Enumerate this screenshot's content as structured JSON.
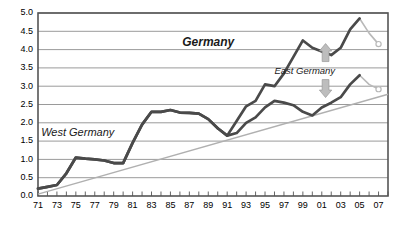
{
  "chart_data": {
    "type": "line",
    "title": "",
    "subtitle": "",
    "xlabel": "",
    "ylabel": "",
    "xlim": [
      1971,
      2008
    ],
    "ylim": [
      0.0,
      5.0
    ],
    "grid": true,
    "legend_position": "inline-annotations",
    "y_ticks": [
      "0.0",
      "0.5",
      "1.0",
      "1.5",
      "2.0",
      "2.5",
      "3.0",
      "3.5",
      "4.0",
      "4.5",
      "5.0"
    ],
    "y_tick_values": [
      0.0,
      0.5,
      1.0,
      1.5,
      2.0,
      2.5,
      3.0,
      3.5,
      4.0,
      4.5,
      5.0
    ],
    "x_tick_labels": [
      "71",
      "73",
      "75",
      "77",
      "79",
      "81",
      "83",
      "85",
      "87",
      "89",
      "91",
      "93",
      "95",
      "97",
      "99",
      "01",
      "03",
      "05",
      "07"
    ],
    "x_tick_values": [
      1971,
      1973,
      1975,
      1977,
      1979,
      1981,
      1983,
      1985,
      1987,
      1989,
      1991,
      1993,
      1995,
      1997,
      1999,
      2001,
      2003,
      2005,
      2007
    ],
    "x_minor_ticks": [
      1971,
      1972,
      1973,
      1974,
      1975,
      1976,
      1977,
      1978,
      1979,
      1980,
      1981,
      1982,
      1983,
      1984,
      1985,
      1986,
      1987,
      1988,
      1989,
      1990,
      1991,
      1992,
      1993,
      1994,
      1995,
      1996,
      1997,
      1998,
      1999,
      2000,
      2001,
      2002,
      2003,
      2004,
      2005,
      2006,
      2007,
      2008
    ],
    "series": [
      {
        "name": "Germany",
        "label": "Germany",
        "color": "#4a4a4a",
        "style": "bold-italic",
        "label_x": 1989,
        "label_y": 4.18,
        "x": [
          1971,
          1972,
          1973,
          1974,
          1975,
          1976,
          1977,
          1978,
          1979,
          1980,
          1981,
          1982,
          1983,
          1984,
          1985,
          1986,
          1987,
          1988,
          1989,
          1990,
          1991,
          1992,
          1993,
          1994,
          1995,
          1996,
          1997,
          1998,
          1999,
          2000,
          2001,
          2002,
          2003,
          2004,
          2005
        ],
        "values": [
          0.2,
          0.25,
          0.3,
          0.62,
          1.05,
          1.02,
          1.0,
          0.97,
          0.9,
          0.9,
          1.45,
          1.95,
          2.3,
          2.3,
          2.35,
          2.28,
          2.27,
          2.25,
          2.1,
          1.85,
          1.65,
          2.05,
          2.45,
          2.6,
          3.05,
          3.0,
          3.35,
          3.8,
          4.25,
          4.05,
          3.95,
          3.85,
          4.05,
          4.55,
          4.85
        ]
      },
      {
        "name": "Germany forecast",
        "label": "",
        "color": "#b9b9b9",
        "style": "forecast-tail",
        "x": [
          2005,
          2006,
          2007
        ],
        "values": [
          4.85,
          4.45,
          4.15
        ],
        "end_marker": "open-circle"
      },
      {
        "name": "West Germany",
        "label": "West Germany",
        "color": "#4a4a4a",
        "style": "italic",
        "label_x": 1975.2,
        "label_y": 1.72,
        "x": [
          1971,
          1972,
          1973,
          1974,
          1975,
          1976,
          1977,
          1978,
          1979,
          1980,
          1981,
          1982,
          1983,
          1984,
          1985,
          1986,
          1987,
          1988,
          1989,
          1990
        ],
        "values": [
          0.2,
          0.25,
          0.3,
          0.62,
          1.05,
          1.02,
          1.0,
          0.97,
          0.9,
          0.9,
          1.45,
          1.95,
          2.3,
          2.3,
          2.35,
          2.28,
          2.27,
          2.25,
          2.1,
          1.85
        ]
      },
      {
        "name": "West Germany post-1990",
        "label": "",
        "color": "#4a4a4a",
        "style": "solid",
        "x": [
          1990,
          1991,
          1992,
          1993,
          1994,
          1995,
          1996,
          1997,
          1998,
          1999,
          2000,
          2001,
          2002,
          2003,
          2004,
          2005
        ],
        "values": [
          1.85,
          1.65,
          1.72,
          2.0,
          2.15,
          2.42,
          2.6,
          2.55,
          2.48,
          2.3,
          2.2,
          2.42,
          2.55,
          2.7,
          3.05,
          3.3
        ]
      },
      {
        "name": "West Germany forecast",
        "label": "",
        "color": "#b9b9b9",
        "style": "forecast-tail",
        "x": [
          2005,
          2006,
          2007
        ],
        "values": [
          3.3,
          3.05,
          2.92
        ],
        "end_marker": "open-circle"
      },
      {
        "name": "Trend",
        "label": "",
        "color": "#b0b0b0",
        "style": "trendline",
        "x": [
          1971,
          2008
        ],
        "values": [
          0.05,
          2.78
        ]
      }
    ],
    "annotations": [
      {
        "text": "East Germany",
        "type": "gap-label",
        "x": 1999.2,
        "y": 3.4,
        "arrows": [
          "up",
          "down"
        ],
        "arrow_x": 2001.4,
        "arrow_color": "#bdbdbd"
      }
    ]
  },
  "axis": {
    "frame_color": "#555555",
    "grid_color": "#8f8f8f"
  }
}
